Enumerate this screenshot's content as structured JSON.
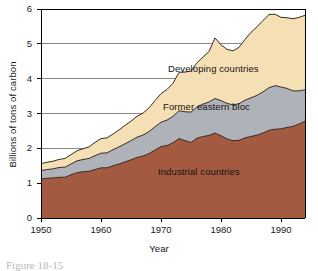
{
  "figure": {
    "caption_number": "Figure 18-15",
    "caption_text": "Figure 18-15"
  },
  "chart_data": {
    "type": "area",
    "stacked": true,
    "title": "",
    "xlabel": "Year",
    "ylabel": "Billions of tons of carbon",
    "xlim": [
      1950,
      1994
    ],
    "ylim": [
      0,
      6
    ],
    "xticks": [
      1950,
      1960,
      1970,
      1980,
      1990
    ],
    "yticks": [
      0,
      1,
      2,
      3,
      4,
      5,
      6
    ],
    "grid": "horizontal",
    "legend_position": "inline-labels",
    "colors": {
      "industrial": "#A35A40",
      "eastern": "#AFB2B8",
      "developing": "#F5DFB5",
      "outline": "#3a2d24",
      "axis": "#000000",
      "gridline": "#8a8a8a"
    },
    "x": [
      1950,
      1951,
      1952,
      1953,
      1954,
      1955,
      1956,
      1957,
      1958,
      1959,
      1960,
      1961,
      1962,
      1963,
      1964,
      1965,
      1966,
      1967,
      1968,
      1969,
      1970,
      1971,
      1972,
      1973,
      1974,
      1975,
      1976,
      1977,
      1978,
      1979,
      1980,
      1981,
      1982,
      1983,
      1984,
      1985,
      1986,
      1987,
      1988,
      1989,
      1990,
      1991,
      1992,
      1993,
      1994
    ],
    "series": [
      {
        "name": "Industrial countries",
        "label": "Industrial countries",
        "color": "#A35A40",
        "values": [
          1.12,
          1.14,
          1.15,
          1.17,
          1.17,
          1.24,
          1.3,
          1.33,
          1.34,
          1.39,
          1.44,
          1.44,
          1.5,
          1.55,
          1.61,
          1.67,
          1.74,
          1.78,
          1.85,
          1.95,
          2.05,
          2.08,
          2.16,
          2.28,
          2.22,
          2.17,
          2.29,
          2.34,
          2.37,
          2.44,
          2.36,
          2.27,
          2.22,
          2.23,
          2.3,
          2.34,
          2.38,
          2.44,
          2.52,
          2.55,
          2.56,
          2.6,
          2.63,
          2.7,
          2.78
        ]
      },
      {
        "name": "Former eastern bloc",
        "label": "Former eastern bloc",
        "color": "#AFB2B8",
        "values": [
          0.24,
          0.25,
          0.26,
          0.28,
          0.29,
          0.31,
          0.34,
          0.35,
          0.37,
          0.4,
          0.42,
          0.43,
          0.46,
          0.49,
          0.52,
          0.55,
          0.58,
          0.6,
          0.63,
          0.67,
          0.7,
          0.73,
          0.76,
          0.8,
          0.83,
          0.87,
          0.9,
          0.93,
          0.96,
          0.99,
          1.01,
          1.02,
          1.03,
          1.05,
          1.08,
          1.11,
          1.14,
          1.18,
          1.22,
          1.25,
          1.2,
          1.12,
          1.02,
          0.95,
          0.9
        ]
      },
      {
        "name": "Developing countries",
        "label": "Developing countries",
        "color": "#F5DFB5",
        "values": [
          0.2,
          0.21,
          0.22,
          0.23,
          0.25,
          0.27,
          0.29,
          0.31,
          0.33,
          0.38,
          0.42,
          0.43,
          0.45,
          0.49,
          0.53,
          0.56,
          0.6,
          0.63,
          0.68,
          0.75,
          0.82,
          0.88,
          0.95,
          1.1,
          1.14,
          1.18,
          1.27,
          1.35,
          1.45,
          1.74,
          1.6,
          1.55,
          1.55,
          1.62,
          1.75,
          1.88,
          1.97,
          2.05,
          2.1,
          2.05,
          2.0,
          2.03,
          2.07,
          2.11,
          2.14
        ]
      }
    ],
    "totals": [
      1.56,
      1.6,
      1.63,
      1.68,
      1.71,
      1.82,
      1.93,
      1.99,
      2.04,
      2.17,
      2.28,
      2.3,
      2.41,
      2.53,
      2.66,
      2.78,
      2.92,
      3.01,
      3.16,
      3.37,
      3.57,
      3.69,
      3.87,
      4.18,
      4.19,
      4.22,
      4.46,
      4.62,
      4.78,
      5.17,
      4.97,
      4.84,
      4.8,
      4.9,
      5.13,
      5.33,
      5.49,
      5.67,
      5.84,
      5.85,
      5.76,
      5.75,
      5.72,
      5.76,
      5.82
    ]
  }
}
